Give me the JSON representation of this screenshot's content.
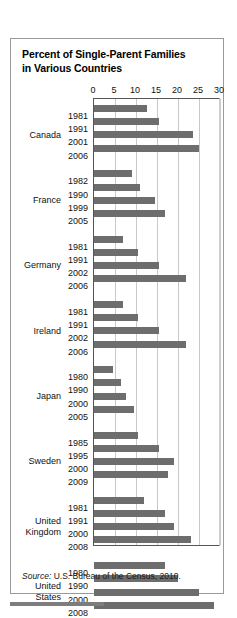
{
  "figure": {
    "title": "Percent of Single-Parent Families in Various Countries",
    "title_line1": "Percent of Single-Parent Families",
    "title_line2": "in Various Countries",
    "source_word": "Source:",
    "source_text": " U.S. Bureau of the Census, 2010.",
    "bar_color": "#6d6d6d",
    "grid_color": "#c9c9c9",
    "axis_color": "#555555",
    "panel_border_color": "#9a9a9a"
  },
  "chart_data": {
    "type": "bar",
    "orientation": "horizontal",
    "title": "Percent of Single-Parent Families in Various Countries",
    "xlabel": "",
    "ylabel": "",
    "xlim": [
      0,
      30
    ],
    "xticks": [
      0,
      5,
      10,
      15,
      20,
      25,
      30
    ],
    "xtick_labels": [
      "0",
      "5",
      "10",
      "15",
      "20",
      "25",
      "30"
    ],
    "grid": true,
    "legend": false,
    "groups": [
      {
        "country": "Canada",
        "country_lines": [
          "Canada"
        ],
        "categories": [
          "1981",
          "1991",
          "2001",
          "2006"
        ],
        "values": [
          12.5,
          15.5,
          23.5,
          25
        ]
      },
      {
        "country": "France",
        "country_lines": [
          "France"
        ],
        "categories": [
          "1982",
          "1990",
          "1999",
          "2005"
        ],
        "values": [
          9,
          11,
          14.5,
          17
        ]
      },
      {
        "country": "Germany",
        "country_lines": [
          "Germany"
        ],
        "categories": [
          "1981",
          "1991",
          "2002",
          "2006"
        ],
        "values": [
          7,
          10.5,
          15.5,
          22
        ]
      },
      {
        "country": "Ireland",
        "country_lines": [
          "Ireland"
        ],
        "categories": [
          "1981",
          "1991",
          "2002",
          "2006"
        ],
        "values": [
          7,
          10.5,
          15.5,
          22
        ]
      },
      {
        "country": "Japan",
        "country_lines": [
          "Japan"
        ],
        "categories": [
          "1980",
          "1990",
          "2000",
          "2005"
        ],
        "values": [
          4.5,
          6.5,
          7.5,
          9.5
        ]
      },
      {
        "country": "Sweden",
        "country_lines": [
          "Sweden"
        ],
        "categories": [
          "1985",
          "1995",
          "2000",
          "2009"
        ],
        "values": [
          10.5,
          15.5,
          19,
          17.5
        ]
      },
      {
        "country": "United Kingdom",
        "country_lines": [
          "United",
          "Kingdom"
        ],
        "categories": [
          "1981",
          "1991",
          "2000",
          "2008"
        ],
        "values": [
          12,
          17,
          19,
          23
        ]
      },
      {
        "country": "United States",
        "country_lines": [
          "United",
          "States"
        ],
        "categories": [
          "1980",
          "1990",
          "2000",
          "2008"
        ],
        "values": [
          17,
          20,
          25,
          28.5
        ]
      }
    ],
    "source": "Source: U.S. Bureau of the Census, 2010."
  }
}
